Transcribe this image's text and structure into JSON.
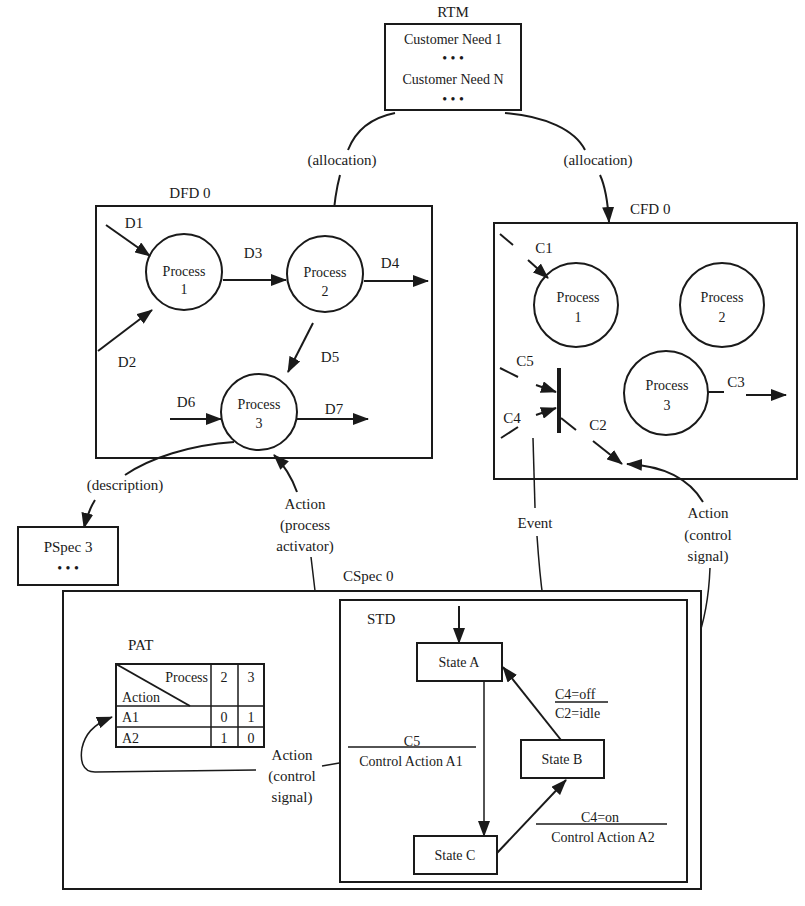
{
  "rtm": {
    "title": "RTM",
    "lines": [
      "Customer Need 1",
      "• • •",
      "Customer Need N",
      "• • •"
    ]
  },
  "allocation_left": "(allocation)",
  "allocation_right": "(allocation)",
  "dfd": {
    "title": "DFD 0",
    "processes": [
      {
        "label": "Process",
        "num": "1"
      },
      {
        "label": "Process",
        "num": "2"
      },
      {
        "label": "Process",
        "num": "3"
      }
    ],
    "flows": {
      "d1": "D1",
      "d2": "D2",
      "d3": "D3",
      "d4": "D4",
      "d5": "D5",
      "d6": "D6",
      "d7": "D7"
    }
  },
  "cfd": {
    "title": "CFD 0",
    "processes": [
      {
        "label": "Process",
        "num": "1"
      },
      {
        "label": "Process",
        "num": "2"
      },
      {
        "label": "Process",
        "num": "3"
      }
    ],
    "flows": {
      "c1": "C1",
      "c2": "C2",
      "c3": "C3",
      "c4": "C4",
      "c5": "C5"
    }
  },
  "description_label": "(description)",
  "pspec": {
    "title": "PSpec 3",
    "dots": "• • •"
  },
  "action_process_activator": [
    "Action",
    "(process",
    "activator)"
  ],
  "event_label": "Event",
  "action_control_signal_right": [
    "Action",
    "(control",
    "signal)"
  ],
  "action_control_signal_left": [
    "Action",
    "(control",
    "signal)"
  ],
  "cspec": {
    "title": "CSpec 0",
    "pat": {
      "title": "PAT",
      "header_process": "Process",
      "header_action": "Action",
      "columns": [
        "2",
        "3"
      ],
      "rows": [
        {
          "action": "A1",
          "values": [
            "0",
            "1"
          ]
        },
        {
          "action": "A2",
          "values": [
            "1",
            "0"
          ]
        }
      ]
    },
    "std": {
      "title": "STD",
      "states": [
        "State A",
        "State B",
        "State C"
      ],
      "transitions": [
        {
          "condition": "C4=off",
          "action": "C2=idle"
        },
        {
          "condition": "C5",
          "action": "Control Action A1"
        },
        {
          "condition": "C4=on",
          "action": "Control Action A2"
        }
      ]
    }
  }
}
